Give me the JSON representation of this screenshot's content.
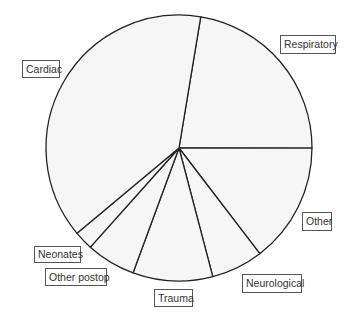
{
  "chart_data": {
    "type": "pie",
    "title": "",
    "start_angle_deg": 9.4,
    "direction": "clockwise",
    "categories": [
      "Respiratory",
      "Other",
      "Neurological",
      "Trauma",
      "Other postop",
      "Neonates",
      "Cardiac"
    ],
    "values": [
      22.4,
      14.6,
      6.3,
      9.7,
      6.0,
      2.3,
      38.7
    ],
    "unit": "percent (estimated from slice angles)",
    "fill_color": "#f6f6f6",
    "stroke_color": "#222222",
    "legend": "none (callout labels in boxes)"
  },
  "labels": [
    {
      "text": "Respiratory",
      "x": 280,
      "y": 35,
      "w": 56,
      "h": 19
    },
    {
      "text": "Other",
      "x": 302,
      "y": 212,
      "w": 30,
      "h": 19
    },
    {
      "text": "Neurological",
      "x": 242,
      "y": 274,
      "w": 60,
      "h": 19
    },
    {
      "text": "Trauma",
      "x": 154,
      "y": 289,
      "w": 39,
      "h": 18
    },
    {
      "text": "Other postop",
      "x": 45,
      "y": 268,
      "w": 62,
      "h": 18
    },
    {
      "text": "Neonates",
      "x": 34,
      "y": 246,
      "w": 47,
      "h": 17
    },
    {
      "text": "Cardiac",
      "x": 22,
      "y": 60,
      "w": 38,
      "h": 18
    }
  ]
}
